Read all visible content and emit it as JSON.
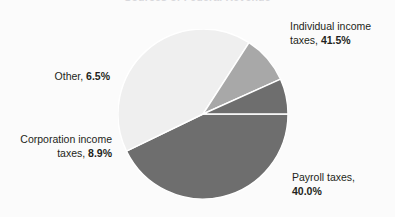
{
  "chart_data": {
    "type": "pie",
    "title": "Sources of Federal Revenue",
    "categories": [
      "Individual income taxes",
      "Payroll taxes",
      "Corporation income taxes",
      "Other"
    ],
    "values": [
      41.5,
      40.0,
      8.9,
      6.5
    ],
    "value_unit": "percent",
    "labels": [
      "Individual income taxes, 41.5%",
      "Payroll taxes, 40.0%",
      "Corporation income taxes, 8.9%",
      "Other, 6.5%"
    ],
    "colors": [
      "#6e6e6e",
      "#efefef",
      "#a8a8a8",
      "#6e6e6e"
    ],
    "slice_separator_color": "#ffffff",
    "background": "#fbfbfb",
    "legend": "none",
    "labels_position": "outside",
    "start_angle_deg": 0,
    "direction": "clockwise"
  },
  "labels": {
    "individual": {
      "name": "Individual income",
      "name2": "taxes, ",
      "pct": "41.5%"
    },
    "payroll": {
      "name": "Payroll taxes,",
      "pct": "40.0%"
    },
    "corporation": {
      "name": "Corporation income",
      "name2": "taxes, ",
      "pct": "8.9%"
    },
    "other": {
      "name": "Other, ",
      "pct": "6.5%"
    }
  }
}
